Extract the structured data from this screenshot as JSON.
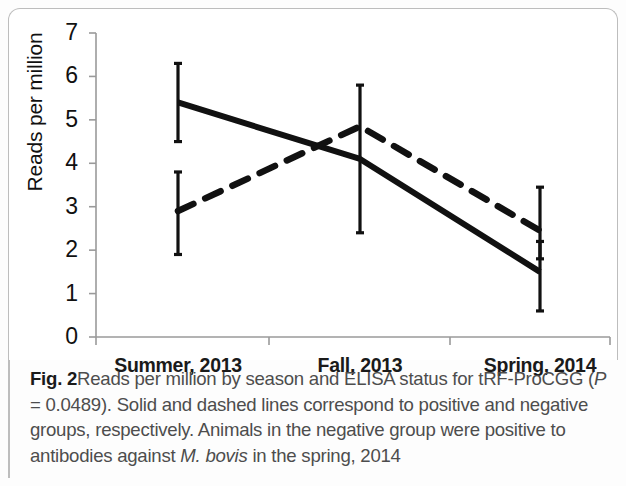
{
  "figure": {
    "label": "Fig. 2",
    "caption_parts": {
      "p1": "Reads per million by season and ELISA status for tRF-ProCGG (",
      "p_italic": "P",
      "p2": " = 0.0489). Solid and dashed lines correspond to positive and negative groups, respectively. Animals in the negative group were positive to antibodies against ",
      "m_bovis": "M. bovis",
      "p3": " in the spring, 2014"
    }
  },
  "chart_data": {
    "type": "line",
    "title": "",
    "xlabel": "",
    "ylabel": "Reads per million",
    "categories": [
      "Summer, 2013",
      "Fall, 2013",
      "Spring, 2014"
    ],
    "ylim": [
      0,
      7
    ],
    "yticks": [
      0,
      1,
      2,
      3,
      4,
      5,
      6,
      7
    ],
    "ytick_labels": [
      "0",
      "1",
      "2",
      "3",
      "4",
      "5",
      "6",
      "7"
    ],
    "grid": false,
    "legend": "none",
    "series": [
      {
        "name": "positive",
        "style": "solid",
        "color": "#111111",
        "values": [
          5.4,
          4.1,
          1.5
        ],
        "err_low": [
          4.5,
          2.4,
          0.6
        ],
        "err_high": [
          6.3,
          5.8,
          2.2
        ]
      },
      {
        "name": "negative",
        "style": "dashed",
        "color": "#111111",
        "values": [
          2.9,
          4.85,
          2.45
        ],
        "err_low": [
          1.9,
          4.85,
          1.8
        ],
        "err_high": [
          3.8,
          4.85,
          3.45
        ]
      }
    ]
  }
}
